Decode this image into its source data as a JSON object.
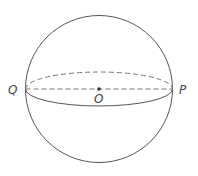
{
  "diagram": {
    "type": "sphere",
    "colors": {
      "stroke": "#555555",
      "dashed": "#777777",
      "label": "#444444",
      "background": "#ffffff"
    },
    "sphere": {
      "cx": 99,
      "cy": 89,
      "r": 74
    },
    "equator": {
      "cx": 99,
      "cy": 89,
      "rx": 74,
      "ry": 17
    },
    "points": {
      "Q": {
        "label": "Q",
        "x": 25,
        "y": 89
      },
      "P": {
        "label": "P",
        "x": 173,
        "y": 89
      },
      "O": {
        "label": "O",
        "x": 99,
        "y": 89
      }
    },
    "labels": {
      "q": "Q",
      "p": "P",
      "o": "O"
    }
  }
}
